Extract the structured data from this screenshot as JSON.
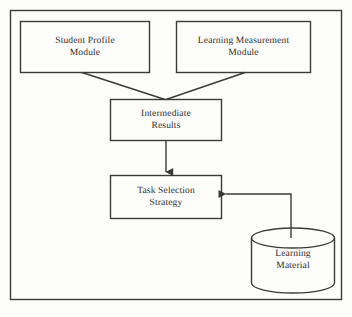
{
  "figure": {
    "type": "block-diagram",
    "stroke_color": "#3a3a3a",
    "text_color": "#2b2b2b",
    "background_color": "#fdfdfc"
  },
  "nodes": {
    "student_profile": {
      "shape": "rectangle",
      "line1": "Student Profile",
      "line2": "Module"
    },
    "learning_measurement": {
      "shape": "rectangle",
      "line1": "Learning Measurement",
      "line2": "Module"
    },
    "intermediate_results": {
      "shape": "rectangle",
      "line1": "Intermediate",
      "line2": "Results"
    },
    "task_selection": {
      "shape": "rectangle",
      "line1": "Task Selection",
      "line2": "Strategy"
    },
    "learning_material": {
      "shape": "cylinder",
      "line1": "Learning",
      "line2": "Material"
    }
  },
  "edges": [
    {
      "from": "student_profile",
      "to": "intermediate_results",
      "style": "diagonal-line",
      "arrowhead": false
    },
    {
      "from": "learning_measurement",
      "to": "intermediate_results",
      "style": "diagonal-line",
      "arrowhead": false
    },
    {
      "from": "intermediate_results",
      "to": "task_selection",
      "style": "vertical-line",
      "arrowhead": true,
      "direction": "down"
    },
    {
      "from": "learning_material",
      "to": "task_selection",
      "style": "elbow-line",
      "arrowhead": true,
      "direction": "left"
    }
  ]
}
